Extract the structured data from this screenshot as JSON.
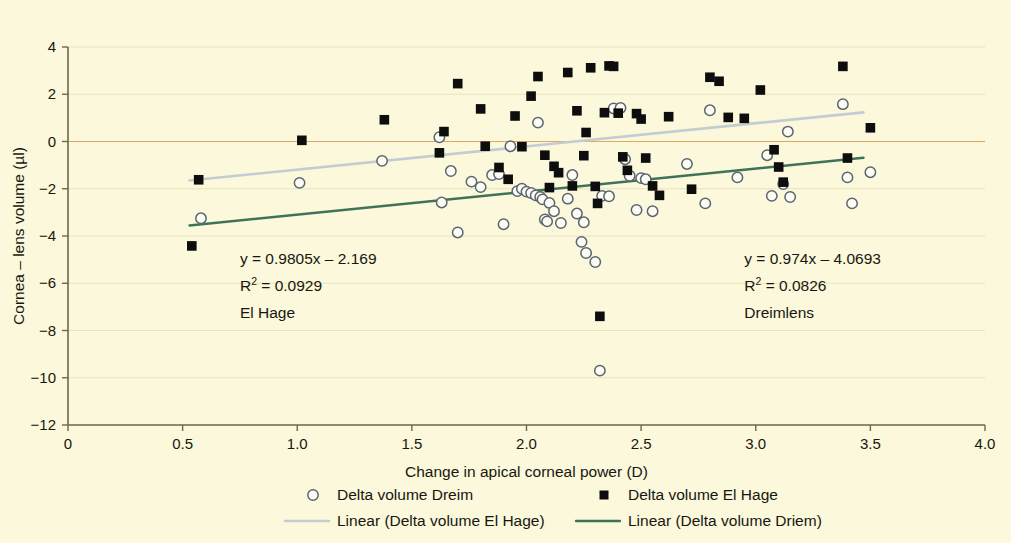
{
  "figure": {
    "background_color": "#FBF8DC",
    "width": 1011,
    "height": 543
  },
  "chart_data": {
    "type": "scatter",
    "title": "",
    "xlabel": "Change in apical corneal power (D)",
    "ylabel": "Cornea – lens volume (µl)",
    "xlim": [
      0,
      4.0
    ],
    "ylim": [
      -12,
      4
    ],
    "xticks": [
      "0",
      "0.5",
      "1.0",
      "1.5",
      "2.0",
      "2.5",
      "3.0",
      "3.5",
      "4.0"
    ],
    "xtick_values": [
      0,
      0.5,
      1.0,
      1.5,
      2.0,
      2.5,
      3.0,
      3.5,
      4.0
    ],
    "yticks": [
      "4",
      "2",
      "0",
      "−2",
      "−4",
      "−6",
      "−8",
      "−10",
      "−12"
    ],
    "ytick_values": [
      4,
      2,
      0,
      -2,
      -4,
      -6,
      -8,
      -10,
      -12
    ],
    "grid": true,
    "grid_color": "#e8e3bb",
    "zero_line_color": "#e0a860",
    "legend_position": "bottom",
    "series": [
      {
        "name": "Delta volume Dreim",
        "marker": "open-circle",
        "color": "#5b6570",
        "fill": "#FCFCF2",
        "points": [
          [
            0.58,
            -3.25
          ],
          [
            1.01,
            -1.75
          ],
          [
            1.37,
            -0.82
          ],
          [
            1.62,
            0.18
          ],
          [
            1.63,
            -2.58
          ],
          [
            1.67,
            -1.25
          ],
          [
            1.7,
            -3.85
          ],
          [
            1.76,
            -1.7
          ],
          [
            1.8,
            -1.93
          ],
          [
            1.85,
            -1.42
          ],
          [
            1.88,
            -1.38
          ],
          [
            1.9,
            -3.5
          ],
          [
            1.93,
            -0.2
          ],
          [
            1.96,
            -2.1
          ],
          [
            1.98,
            -2.0
          ],
          [
            2.0,
            -2.12
          ],
          [
            2.02,
            -2.18
          ],
          [
            2.04,
            -2.28
          ],
          [
            2.05,
            0.8
          ],
          [
            2.06,
            -2.35
          ],
          [
            2.07,
            -2.45
          ],
          [
            2.08,
            -3.3
          ],
          [
            2.09,
            -3.38
          ],
          [
            2.1,
            -2.6
          ],
          [
            2.12,
            -2.95
          ],
          [
            2.15,
            -3.45
          ],
          [
            2.18,
            -2.42
          ],
          [
            2.2,
            -1.42
          ],
          [
            2.22,
            -3.05
          ],
          [
            2.24,
            -4.25
          ],
          [
            2.25,
            -3.42
          ],
          [
            2.26,
            -4.72
          ],
          [
            2.3,
            -5.1
          ],
          [
            2.32,
            -9.7
          ],
          [
            2.33,
            -2.3
          ],
          [
            2.36,
            -2.32
          ],
          [
            2.38,
            1.4
          ],
          [
            2.41,
            1.42
          ],
          [
            2.43,
            -0.75
          ],
          [
            2.45,
            -1.45
          ],
          [
            2.48,
            -2.9
          ],
          [
            2.5,
            -1.55
          ],
          [
            2.52,
            -1.6
          ],
          [
            2.55,
            -2.95
          ],
          [
            2.7,
            -0.95
          ],
          [
            2.78,
            -2.62
          ],
          [
            2.8,
            1.32
          ],
          [
            2.92,
            -1.52
          ],
          [
            3.05,
            -0.58
          ],
          [
            3.07,
            -2.3
          ],
          [
            3.12,
            -1.8
          ],
          [
            3.14,
            0.42
          ],
          [
            3.15,
            -2.35
          ],
          [
            3.38,
            1.58
          ],
          [
            3.4,
            -1.52
          ],
          [
            3.42,
            -2.62
          ],
          [
            3.5,
            -1.3
          ]
        ]
      },
      {
        "name": "Delta volume El Hage",
        "marker": "filled-square",
        "color": "#0d0d0d",
        "points": [
          [
            0.54,
            -4.42
          ],
          [
            0.57,
            -1.62
          ],
          [
            1.02,
            0.05
          ],
          [
            1.38,
            0.92
          ],
          [
            1.62,
            -0.48
          ],
          [
            1.64,
            0.42
          ],
          [
            1.7,
            2.45
          ],
          [
            1.8,
            1.38
          ],
          [
            1.82,
            -0.2
          ],
          [
            1.88,
            -1.1
          ],
          [
            1.92,
            -1.6
          ],
          [
            1.95,
            1.08
          ],
          [
            1.98,
            -0.22
          ],
          [
            2.02,
            1.92
          ],
          [
            2.05,
            2.75
          ],
          [
            2.08,
            -0.58
          ],
          [
            2.1,
            -1.95
          ],
          [
            2.12,
            -1.05
          ],
          [
            2.14,
            -1.32
          ],
          [
            2.18,
            2.92
          ],
          [
            2.2,
            -1.88
          ],
          [
            2.22,
            1.3
          ],
          [
            2.25,
            -0.6
          ],
          [
            2.26,
            0.38
          ],
          [
            2.28,
            3.12
          ],
          [
            2.3,
            -1.9
          ],
          [
            2.31,
            -2.62
          ],
          [
            2.32,
            -7.4
          ],
          [
            2.34,
            1.22
          ],
          [
            2.36,
            3.2
          ],
          [
            2.38,
            3.18
          ],
          [
            2.4,
            1.2
          ],
          [
            2.42,
            -0.65
          ],
          [
            2.44,
            -1.22
          ],
          [
            2.48,
            1.18
          ],
          [
            2.5,
            0.95
          ],
          [
            2.52,
            -0.7
          ],
          [
            2.55,
            -1.88
          ],
          [
            2.58,
            -2.28
          ],
          [
            2.62,
            1.05
          ],
          [
            2.72,
            -2.02
          ],
          [
            2.8,
            2.72
          ],
          [
            2.84,
            2.55
          ],
          [
            2.88,
            1.02
          ],
          [
            2.95,
            0.98
          ],
          [
            3.02,
            2.18
          ],
          [
            3.08,
            -0.35
          ],
          [
            3.1,
            -1.08
          ],
          [
            3.12,
            -1.72
          ],
          [
            3.38,
            3.18
          ],
          [
            3.4,
            -0.7
          ],
          [
            3.5,
            0.58
          ]
        ]
      }
    ],
    "trendlines": [
      {
        "name": "Linear (Delta volume El Hage)",
        "color": "#c2cdd2",
        "equation": "y = 0.9805x – 2.169",
        "slope": 0.9805,
        "intercept": -2.169,
        "x_range": [
          0.53,
          3.47
        ]
      },
      {
        "name": "Linear (Delta volume Driem)",
        "color": "#3f7359",
        "equation": "y = 0.974x – 4.0693",
        "slope": 0.974,
        "intercept": -4.0693,
        "x_range": [
          0.53,
          3.47
        ]
      }
    ],
    "annotations": [
      {
        "id": "annotation-el-hage",
        "x": 0.75,
        "y": -5.2,
        "lines": [
          "y = 0.9805x – 2.169",
          "R2 = 0.0929",
          "El Hage"
        ],
        "equation": "y = 0.9805x – 2.169",
        "r_label": "R",
        "r_exponent": "2",
        "r_value": "= 0.0929",
        "series_label": "El Hage"
      },
      {
        "id": "annotation-dreimlens",
        "x": 2.95,
        "y": -5.2,
        "lines": [
          "y = 0.974x – 4.0693",
          "R2 = 0.0826",
          "Dreimlens"
        ],
        "equation": "y = 0.974x – 4.0693",
        "r_label": "R",
        "r_exponent": "2",
        "r_value": "= 0.0826",
        "series_label": "Dreimlens"
      }
    ],
    "legend": [
      {
        "label": "Delta volume Dreim",
        "marker": "open-circle",
        "color": "#5b6570"
      },
      {
        "label": "Delta volume El Hage",
        "marker": "filled-square",
        "color": "#0d0d0d"
      },
      {
        "label": "Linear (Delta volume El Hage)",
        "marker": "line",
        "color": "#c2cdd2"
      },
      {
        "label": "Linear (Delta volume Driem)",
        "marker": "line",
        "color": "#3f7359"
      }
    ]
  }
}
